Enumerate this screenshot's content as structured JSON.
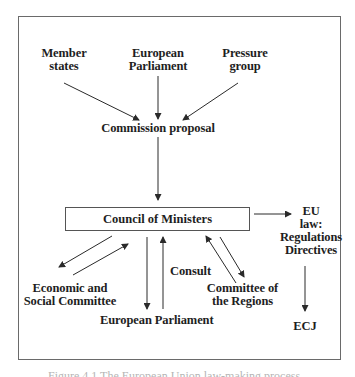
{
  "diagram": {
    "sources": {
      "member_states": [
        "Member",
        "states"
      ],
      "european_parliament": [
        "European",
        "Parliament"
      ],
      "pressure_group": [
        "Pressure",
        "group"
      ]
    },
    "commission_proposal": "Commission proposal",
    "council": "Council of Ministers",
    "eu_law": [
      "EU",
      "law:",
      "Regulations",
      "Directives"
    ],
    "ecj": "ECJ",
    "consultees": {
      "esc": [
        "Economic and",
        "Social Committee"
      ],
      "ep": "European Parliament",
      "consult_label": "Consult",
      "cor": [
        "Committee of",
        "the Regions"
      ]
    },
    "caption": "Figure 4.1  The European Union law-making process",
    "colors": {
      "line": "#2a2a2a",
      "text": "#1e1e1e",
      "frame": "#6a6a6a"
    }
  }
}
